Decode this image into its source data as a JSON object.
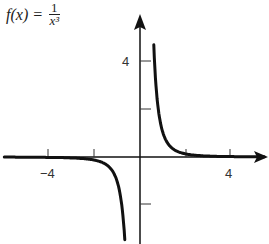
{
  "chart_data": {
    "type": "line",
    "function": "1/x^3",
    "xlabel": "",
    "ylabel": "",
    "xlim": [
      -5.5,
      5.7
    ],
    "ylim": [
      -4,
      6
    ],
    "x_ticks": [
      -4,
      -2,
      2,
      4
    ],
    "x_tick_labels": [
      "-4",
      "4"
    ],
    "y_ticks": [
      4,
      2,
      -2
    ],
    "y_tick_labels": [
      "4"
    ],
    "grid": false,
    "series": [
      {
        "name": "x>0 branch",
        "x": [
          0.56,
          0.6,
          0.7,
          0.8,
          1.0,
          1.25,
          1.5,
          2.0,
          2.5,
          3.0,
          4.0,
          5.5
        ],
        "y": [
          5.7,
          4.63,
          2.92,
          1.95,
          1.0,
          0.51,
          0.3,
          0.125,
          0.064,
          0.037,
          0.016,
          0.006
        ]
      },
      {
        "name": "x<0 branch",
        "x": [
          -5.5,
          -4.0,
          -3.0,
          -2.5,
          -2.0,
          -1.5,
          -1.25,
          -1.0,
          -0.8,
          -0.7,
          -0.62
        ],
        "y": [
          -0.006,
          -0.016,
          -0.037,
          -0.064,
          -0.125,
          -0.3,
          -0.51,
          -1.0,
          -1.95,
          -2.92,
          -4.2
        ]
      }
    ]
  },
  "title": {
    "lhs": "f(x) =",
    "numerator": "1",
    "denominator": "x³"
  },
  "axes": {
    "x_label_neg4": "−4",
    "x_label_4": "4",
    "y_label_4": "4"
  }
}
